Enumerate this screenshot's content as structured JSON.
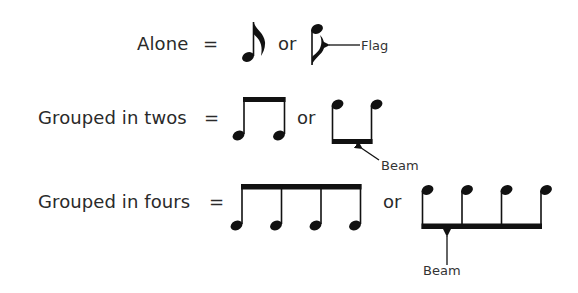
{
  "rows": [
    {
      "label": "Alone",
      "equals": "=",
      "connector": "or",
      "forms": [
        "single eighth note, stem up, flag",
        "single eighth note, stem down, flag"
      ],
      "annotation": "Flag"
    },
    {
      "label": "Grouped in twos",
      "equals": "=",
      "connector": "or",
      "forms": [
        "two eighth notes beamed, stems up",
        "two eighth notes beamed, stems down"
      ],
      "annotation": "Beam"
    },
    {
      "label": "Grouped in fours",
      "equals": "=",
      "connector": "or",
      "forms": [
        "four eighth notes beamed, stems up",
        "four eighth notes beamed, stems down"
      ],
      "annotation": "Beam"
    }
  ],
  "colors": {
    "ink": "#111111",
    "text": "#2a2a2a",
    "background": "#ffffff"
  }
}
